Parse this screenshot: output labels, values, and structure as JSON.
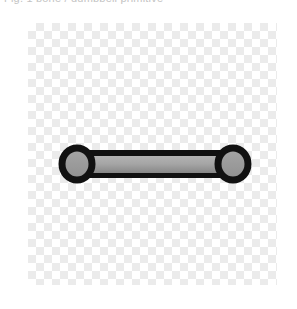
{
  "caption": {
    "text": "Fig. 1  bone / dumbbell primitive"
  },
  "canvas": {
    "label": "transparency-checkerboard",
    "checker_light": "#ffffff",
    "checker_dark": "#ebebeb",
    "checker_cell_px": 8,
    "x": 28,
    "y": 23,
    "width": 249,
    "height": 262
  },
  "shape": {
    "name": "dumbbell",
    "outline_color": "#111111",
    "outline_width": 7,
    "fill_top": "#b0b0b0",
    "fill_bottom": "#8a8a8a",
    "node_fill": "#9a9a9a",
    "left_node": {
      "cx": 77,
      "cy": 164,
      "rx": 15,
      "ry": 16
    },
    "right_node": {
      "cx": 233,
      "cy": 164,
      "rx": 15,
      "ry": 16
    },
    "bar": {
      "x": 77,
      "y": 153,
      "width": 156,
      "height": 22
    }
  }
}
